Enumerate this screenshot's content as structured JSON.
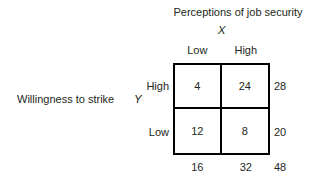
{
  "figure": {
    "kind": "contingency-table",
    "background_color": "#ffffff",
    "text_color": "#231f20",
    "border_color": "#000000"
  },
  "column_variable": {
    "title": "Perceptions of job security",
    "symbol": "X",
    "categories": [
      "Low",
      "High"
    ]
  },
  "row_variable": {
    "title": "Willingness to strike",
    "symbol": "Y",
    "categories": [
      "High",
      "Low"
    ]
  },
  "chart_data": {
    "type": "table",
    "title": "Perceptions of job security",
    "xlabel": "X",
    "ylabel": "Y",
    "categories": [
      "Low",
      "High"
    ],
    "row_categories": [
      "High",
      "Low"
    ],
    "cells": [
      [
        "4",
        "24"
      ],
      [
        "12",
        "8"
      ]
    ],
    "row_totals": [
      "28",
      "20"
    ],
    "column_totals": [
      "16",
      "32"
    ],
    "grand_total": "48",
    "grid": true,
    "legend": "none"
  }
}
